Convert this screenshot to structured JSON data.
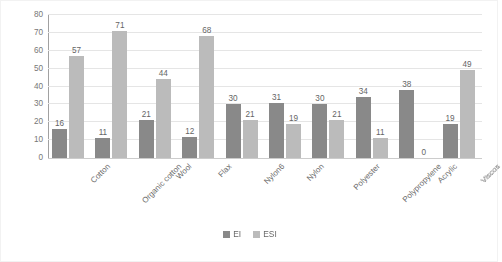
{
  "chart_data": {
    "type": "bar",
    "title": "",
    "subtitle": "",
    "xlabel": "",
    "ylabel": "scores of EI and ESI",
    "ylim": [
      0,
      80
    ],
    "ytick_step": 10,
    "yticks": [
      0,
      10,
      20,
      30,
      40,
      50,
      60,
      70,
      80
    ],
    "grid": true,
    "legend_position": "bottom-center",
    "categories": [
      "Cotton",
      "Organic cotton",
      "Wool",
      "Flax",
      "Nylon6",
      "Nylon",
      "Polyester",
      "Polypropylene",
      "Acrylic",
      "Viscos"
    ],
    "series": [
      {
        "name": "EI",
        "color": "#808080",
        "values": [
          16,
          11,
          21,
          12,
          30,
          31,
          30,
          34,
          38,
          19
        ]
      },
      {
        "name": "ESI",
        "color": "#b6b6b6",
        "values": [
          57,
          71,
          44,
          68,
          21,
          19,
          21,
          11,
          0,
          49
        ]
      }
    ]
  },
  "legend": {
    "items": [
      {
        "label": "EI",
        "color": "#808080"
      },
      {
        "label": "ESI",
        "color": "#b6b6b6"
      }
    ]
  },
  "colors": {
    "series_ei": "#808080",
    "series_esi": "#b6b6b6",
    "gridline": "#e4e4e4",
    "axis": "#9a9a9a",
    "text": "#5c5c5c",
    "background": "#ffffff"
  }
}
